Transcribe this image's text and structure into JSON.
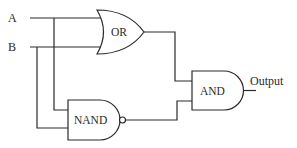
{
  "diagram": {
    "type": "logic-circuit",
    "inputs": [
      {
        "id": "A",
        "label": "A"
      },
      {
        "id": "B",
        "label": "B"
      }
    ],
    "gates": [
      {
        "id": "or",
        "type": "OR",
        "label": "OR",
        "inputs": [
          "A",
          "B"
        ]
      },
      {
        "id": "nand",
        "type": "NAND",
        "label": "NAND",
        "inputs": [
          "A",
          "B"
        ]
      },
      {
        "id": "and",
        "type": "AND",
        "label": "AND",
        "inputs": [
          "or",
          "nand"
        ]
      }
    ],
    "output": {
      "label": "Output",
      "source": "and"
    },
    "colors": {
      "line": "#2a2a2a",
      "background": "#ffffff"
    }
  }
}
